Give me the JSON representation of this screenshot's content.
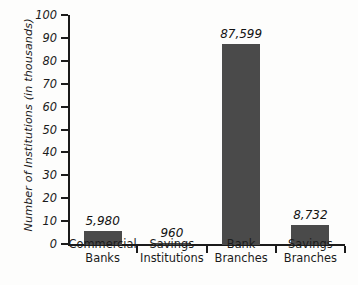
{
  "chart_data": {
    "type": "bar",
    "title": "",
    "xlabel": "",
    "ylabel": "Number of Institutions (in thousands)",
    "categories": [
      "Commercial Banks",
      "Savings Institutions",
      "Bank Branches",
      "Savings Branches"
    ],
    "category_lines": [
      [
        "Commercial",
        "Banks"
      ],
      [
        "Savings",
        "Institutions"
      ],
      [
        "Bank",
        "Branches"
      ],
      [
        "Savings",
        "Branches"
      ]
    ],
    "values": [
      5.98,
      0.96,
      87.599,
      8.732
    ],
    "data_labels": [
      "5,980",
      "960",
      "87,599",
      "8,732"
    ],
    "ylim": [
      0,
      100
    ],
    "ytick_values": [
      0,
      10,
      20,
      30,
      40,
      50,
      60,
      70,
      80,
      90,
      100
    ],
    "ytick_labels": [
      "0",
      "10",
      "20",
      "30",
      "40",
      "50",
      "60",
      "70",
      "80",
      "90",
      "100"
    ],
    "grid": false,
    "legend": null,
    "bar_color": "#4a4a4a",
    "axis_color": "#1b1b1b",
    "background_color": "#fdfdfc"
  }
}
